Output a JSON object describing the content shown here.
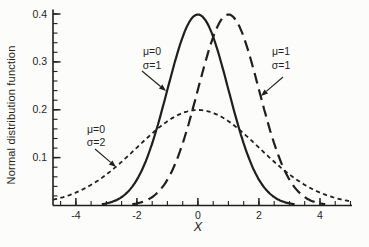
{
  "figure": {
    "background": "#fcfcfa",
    "ink_color": "#1f1f1f"
  },
  "chart_data": {
    "type": "line",
    "title": "",
    "xlabel": "X",
    "ylabel": "Normal distribution function",
    "grid": false,
    "legend_position": "none (inline arrow annotations)",
    "xlim": [
      -4.75,
      5.05
    ],
    "ylim": [
      0,
      0.41
    ],
    "x_major_ticks": [
      -4,
      -2,
      0,
      2,
      4
    ],
    "x_tick_labels": [
      "-4",
      "-2",
      "0",
      "2",
      "4"
    ],
    "x_minor_step": 0.5,
    "y_major_ticks": [
      0.1,
      0.2,
      0.3,
      0.4
    ],
    "y_tick_labels": [
      "0.1",
      "0.2",
      "0.3",
      "0.4"
    ],
    "y_minor_step": 0.02,
    "curve_formula": "f(x) = 1/(sigma*sqrt(2*pi)) * exp(-(x-mu)^2/(2*sigma^2))",
    "series": [
      {
        "name": "normal-mu0-sigma1",
        "label": "μ=0, σ=1",
        "mu": 0,
        "sigma": 1,
        "peak_value": 0.399,
        "line_style": "solid"
      },
      {
        "name": "normal-mu1-sigma1",
        "label": "μ=1, σ=1",
        "mu": 1,
        "sigma": 1,
        "peak_value": 0.399,
        "line_style": "long-dash"
      },
      {
        "name": "normal-mu0-sigma2",
        "label": "μ=0, σ=2",
        "mu": 0,
        "sigma": 2,
        "peak_value": 0.199,
        "line_style": "short-dash"
      }
    ],
    "annotations": [
      {
        "name": "callout-mu0-sigma1",
        "lines": [
          "μ=0",
          "σ=1"
        ],
        "text_x": 152,
        "text_y": 55,
        "arrow": {
          "x1": 142,
          "y1": 71,
          "x2": 166,
          "y2": 91
        }
      },
      {
        "name": "callout-mu1-sigma1",
        "lines": [
          "μ=1",
          "σ=1"
        ],
        "text_x": 281,
        "text_y": 55,
        "arrow": {
          "x1": 283,
          "y1": 77,
          "x2": 261,
          "y2": 96
        }
      },
      {
        "name": "callout-mu0-sigma2",
        "lines": [
          "μ=0",
          "σ=2"
        ],
        "text_x": 96,
        "text_y": 132.5,
        "arrow": {
          "x1": 95,
          "y1": 149,
          "x2": 116,
          "y2": 167
        }
      }
    ]
  }
}
